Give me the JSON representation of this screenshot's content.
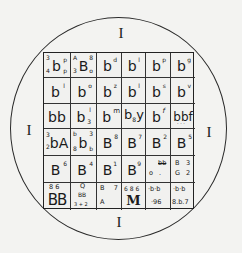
{
  "figure": {
    "type": "wafer-map diagram",
    "outer_marks": {
      "top": "I",
      "left": "I",
      "right": "I",
      "bottom": "I"
    },
    "grid": {
      "columns": 6,
      "rows": 6,
      "cells": [
        [
          {
            "main": "b",
            "tl": "3",
            "bl": "4",
            "tr": "p",
            "br": "p"
          },
          {
            "main": "B",
            "tl": "A",
            "bl": "3",
            "tr": "8",
            "br": "o"
          },
          {
            "main": "b",
            "tr": "d"
          },
          {
            "main": "b",
            "tr": "l"
          },
          {
            "main": "b",
            "tr": "p"
          },
          {
            "main": "b",
            "tr": "g"
          }
        ],
        [
          {
            "main": "b",
            "tr": "l"
          },
          {
            "main": "b",
            "tr": "o"
          },
          {
            "main": "b",
            "tr": "z"
          },
          {
            "main": "b",
            "tr": "l"
          },
          {
            "main": "b",
            "tr": "s"
          },
          {
            "main": "b",
            "tr": "v"
          }
        ],
        [
          {
            "main": "bb"
          },
          {
            "main": "b",
            "tr": "l",
            "br": "3"
          },
          {
            "main": "b",
            "tr": "m"
          },
          {
            "main": "b",
            "sub": "8",
            "after": "y"
          },
          {
            "main": "b",
            "tr": "f"
          },
          {
            "main": "bbf",
            "note": "dots below"
          }
        ],
        [
          {
            "main": "bA",
            "tl": "3",
            "bl": "2"
          },
          {
            "main": "b",
            "tl": "b",
            "bl": "8",
            "tr": "3",
            "br": "b"
          },
          {
            "main": "B",
            "tr": "8"
          },
          {
            "main": "B",
            "tr": "7"
          },
          {
            "main": "B",
            "tr": "2"
          },
          {
            "main": "B",
            "tr": "5"
          }
        ],
        [
          {
            "main": "B",
            "tr": "6"
          },
          {
            "main": "B",
            "tr": "4"
          },
          {
            "main": "B",
            "tr": "1"
          },
          {
            "main": "B",
            "tr": "9"
          },
          {
            "top": "bb",
            "bottom_left": "o",
            "bottom_right": "."
          },
          {
            "top_left": "B",
            "top_right": "3",
            "bottom_left": "G",
            "bottom_right": "2"
          }
        ],
        [
          {
            "top": "8  6",
            "main": "BB"
          },
          {
            "top": "Q",
            "mid": "BB",
            "bottom": "3 + 2"
          },
          {
            "top_left": "B",
            "top_right": "7",
            "bottom_left": "A"
          },
          {
            "top": "6 8 6",
            "main": "M"
          },
          {
            "top": "·b·b",
            "bottom": "·96"
          },
          {
            "top": "·b·b",
            "bottom": "8.b.7"
          }
        ]
      ]
    }
  }
}
